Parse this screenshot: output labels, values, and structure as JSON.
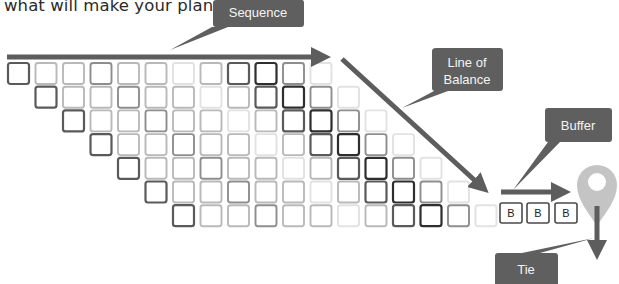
{
  "intro_text": "what will make your plan.",
  "callouts": {
    "sequence": "Sequence",
    "line_of_balance_1": "Line of",
    "line_of_balance_2": "Balance",
    "buffer": "Buffer",
    "tie": "Tie"
  },
  "grid": {
    "rows": 7,
    "cols_per_row": 12,
    "shade_pattern": [
      4,
      2,
      2,
      3,
      2,
      2,
      1,
      2,
      4,
      5,
      3,
      1
    ],
    "shade_colors": {
      "1": "#e2e2e2",
      "2": "#b9b9b9",
      "3": "#8e8e8e",
      "4": "#5a5a5a",
      "5": "#2e2e2e"
    }
  },
  "buffer_boxes": [
    "B",
    "B",
    "B"
  ],
  "colors": {
    "arrow": "#5d5d5d",
    "callout_bg": "#5f5f5f",
    "pin": "#c4c4c4"
  }
}
